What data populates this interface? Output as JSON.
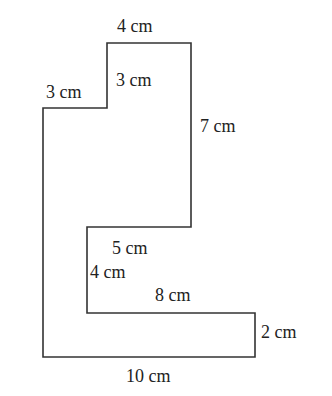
{
  "diagram": {
    "type": "composite-rectilinear-shape",
    "stroke_color": "#333333",
    "fill_color": "#ffffff",
    "outline_points": [
      [
        107,
        43
      ],
      [
        191,
        43
      ],
      [
        191,
        227
      ],
      [
        87,
        227
      ],
      [
        87,
        313
      ],
      [
        255,
        313
      ],
      [
        255,
        357
      ],
      [
        43,
        357
      ],
      [
        43,
        108
      ],
      [
        107,
        108
      ]
    ],
    "labels": [
      {
        "id": "top-width",
        "text": "4 cm",
        "x": 117,
        "y": 17
      },
      {
        "id": "inner-step-height",
        "text": "3 cm",
        "x": 116,
        "y": 71
      },
      {
        "id": "left-step-width",
        "text": "3 cm",
        "x": 46,
        "y": 83
      },
      {
        "id": "right-height",
        "text": "7 cm",
        "x": 200,
        "y": 117
      },
      {
        "id": "notch-width",
        "text": "5 cm",
        "x": 112,
        "y": 239
      },
      {
        "id": "notch-height",
        "text": "4 cm",
        "x": 90,
        "y": 263
      },
      {
        "id": "lower-inner-width",
        "text": "8 cm",
        "x": 155,
        "y": 286
      },
      {
        "id": "lower-right-height",
        "text": "2 cm",
        "x": 261,
        "y": 323
      },
      {
        "id": "bottom-width",
        "text": "10 cm",
        "x": 126,
        "y": 367
      }
    ]
  }
}
